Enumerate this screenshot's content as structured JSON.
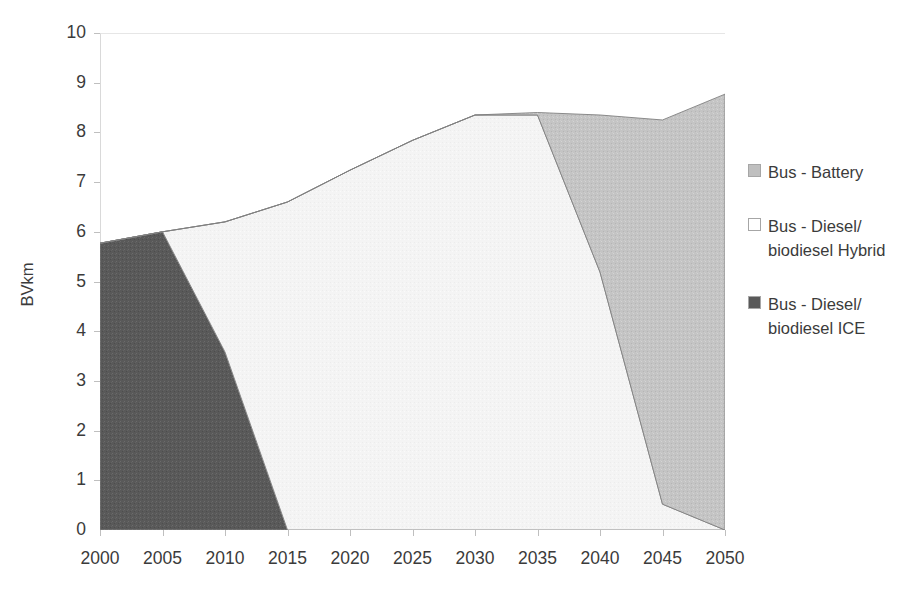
{
  "chart_data": {
    "type": "area",
    "stacked": true,
    "title": "",
    "subtitle": "",
    "xlabel": "",
    "ylabel": "BVkm",
    "x": [
      2000,
      2005,
      2010,
      2015,
      2020,
      2025,
      2030,
      2035,
      2040,
      2045,
      2050
    ],
    "xtick_labels": [
      "2000",
      "2005",
      "2010",
      "2015",
      "2020",
      "2025",
      "2030",
      "2035",
      "2040",
      "2045",
      "2050"
    ],
    "ytick_labels": [
      "0",
      "1",
      "2",
      "3",
      "4",
      "5",
      "6",
      "7",
      "8",
      "9",
      "10"
    ],
    "xlim": [
      2000,
      2050
    ],
    "ylim": [
      0,
      10
    ],
    "grid": false,
    "legend_position": "right",
    "series": [
      {
        "name": "Bus - Battery",
        "color": "#bfbfbf",
        "values": [
          0,
          0,
          0,
          0,
          0,
          0,
          0,
          0.05,
          3.16,
          7.73,
          8.77
        ]
      },
      {
        "name": "Bus - Diesel/ biodiesel Hybrid",
        "color": "#f2f2f2",
        "values": [
          0,
          0,
          2.62,
          6.6,
          7.24,
          7.84,
          8.35,
          8.35,
          5.19,
          0.52,
          0
        ]
      },
      {
        "name": "Bus - Diesel/ biodiesel ICE",
        "color": "#595959",
        "values": [
          5.77,
          6.0,
          3.58,
          0,
          0,
          0,
          0,
          0,
          0,
          0,
          0
        ]
      }
    ],
    "totals": [
      5.77,
      6.0,
      6.2,
      6.6,
      7.24,
      7.84,
      8.35,
      8.4,
      8.35,
      8.25,
      8.77
    ]
  },
  "legend": {
    "items": [
      {
        "label": "Bus - Battery",
        "color": "#bfbfbf"
      },
      {
        "label": "Bus - Diesel/ biodiesel Hybrid",
        "color": "#ffffff"
      },
      {
        "label": "Bus - Diesel/ biodiesel ICE",
        "color": "#595959"
      }
    ]
  },
  "axes": {
    "y_title": "BVkm"
  }
}
